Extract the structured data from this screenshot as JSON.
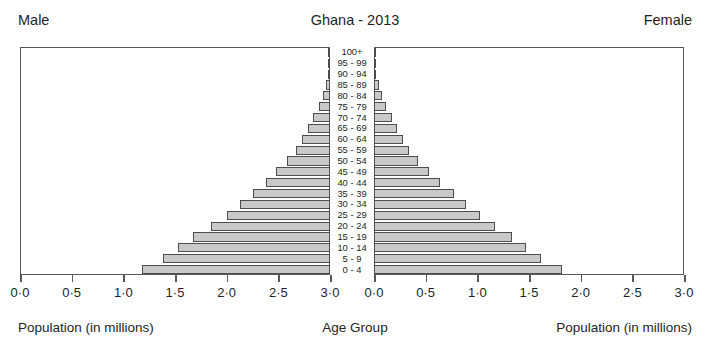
{
  "header": {
    "cut_off_top_text": "",
    "left_label": "Male",
    "title": "Ghana - 2013",
    "right_label": "Female"
  },
  "footer": {
    "left_label": "Population (in millions)",
    "center_label": "Age Group",
    "right_label": "Population (in millions)"
  },
  "axis": {
    "tick_labels_left": [
      "3·0",
      "2·5",
      "2·0",
      "1·5",
      "1·0",
      "0·5",
      "0·0"
    ],
    "tick_labels_right": [
      "0·0",
      "0·5",
      "1·0",
      "1·5",
      "2·0",
      "2·5",
      "3·0"
    ],
    "tick_values": [
      0,
      0.5,
      1.0,
      1.5,
      2.0,
      2.5,
      3.0
    ]
  },
  "colors": {
    "bar_fill": "#c9c9c9",
    "bar_border": "#4d4d4f",
    "frame": "#58585b",
    "text": "#231f20",
    "background": "#ffffff"
  },
  "chart_data": {
    "type": "bar",
    "title": "Ghana - 2013",
    "subtitle": "Population pyramid",
    "xlabel": "Population (in millions)",
    "ylabel": "Age Group",
    "xlim": [
      0,
      3.0
    ],
    "grid": false,
    "legend": [
      "Male",
      "Female"
    ],
    "legend_position": "top-left / top-right",
    "orientation": "horizontal-mirrored",
    "categories": [
      "0 - 4",
      "5 - 9",
      "10 - 14",
      "15 - 19",
      "20 - 24",
      "25 - 29",
      "30 - 34",
      "35 - 39",
      "40 - 44",
      "45 - 49",
      "50 - 54",
      "55 - 59",
      "60 - 64",
      "65 - 69",
      "70 - 74",
      "75 - 79",
      "80 - 84",
      "85 - 89",
      "90 - 94",
      "95 - 99",
      "100+"
    ],
    "series": [
      {
        "name": "Male",
        "side": "left",
        "values": [
          1.82,
          1.62,
          1.47,
          1.33,
          1.15,
          1.0,
          0.87,
          0.75,
          0.62,
          0.52,
          0.42,
          0.33,
          0.27,
          0.21,
          0.16,
          0.11,
          0.07,
          0.04,
          0.02,
          0.01,
          0.004
        ]
      },
      {
        "name": "Female",
        "side": "right",
        "values": [
          1.82,
          1.62,
          1.47,
          1.34,
          1.17,
          1.03,
          0.89,
          0.77,
          0.64,
          0.53,
          0.43,
          0.34,
          0.28,
          0.22,
          0.17,
          0.12,
          0.08,
          0.045,
          0.022,
          0.01,
          0.004
        ]
      }
    ]
  }
}
